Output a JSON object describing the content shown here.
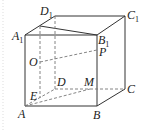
{
  "diagram": {
    "type": "geometry-figure",
    "labels": {
      "D1": {
        "base": "D",
        "sub": "1"
      },
      "C1": {
        "base": "C",
        "sub": "1"
      },
      "A1": {
        "base": "A",
        "sub": "1"
      },
      "B1": {
        "base": "B",
        "sub": "1"
      },
      "P": "P",
      "O": "O",
      "D": "D",
      "M": "M",
      "E": "E",
      "C": "C",
      "A": "A",
      "B": "B"
    },
    "colors": {
      "line": "#333333",
      "dashed": "#777777",
      "text": "#222222"
    }
  }
}
